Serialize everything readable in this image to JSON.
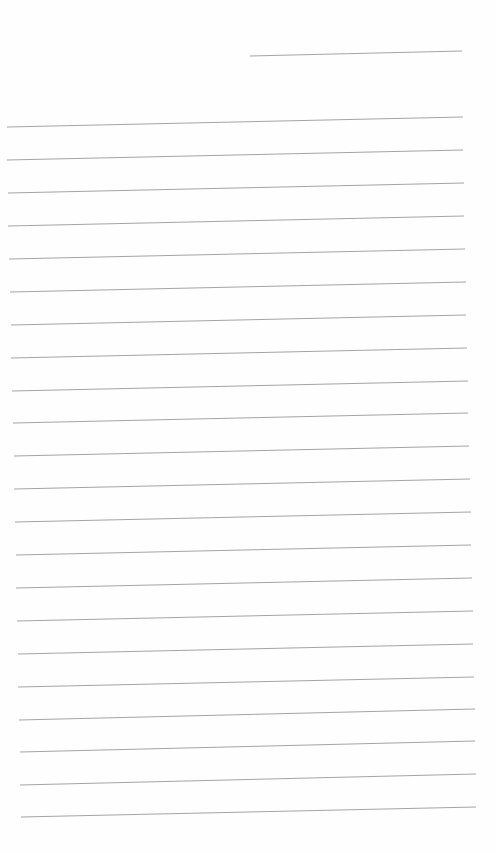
{
  "page": {
    "type": "lined-paper",
    "background": "#fefefe",
    "line_color": "#9a9a9a",
    "header_line": {
      "x1": 250,
      "y1": 56,
      "x2": 462,
      "y2": 51
    },
    "ruled_lines": [
      {
        "x1": 7,
        "y1": 127,
        "x2": 463,
        "y2": 117
      },
      {
        "x1": 7,
        "y1": 160,
        "x2": 463,
        "y2": 150
      },
      {
        "x1": 8,
        "y1": 193,
        "x2": 464,
        "y2": 183
      },
      {
        "x1": 8,
        "y1": 226,
        "x2": 464,
        "y2": 216
      },
      {
        "x1": 9,
        "y1": 259,
        "x2": 465,
        "y2": 249
      },
      {
        "x1": 10,
        "y1": 292,
        "x2": 466,
        "y2": 282
      },
      {
        "x1": 11,
        "y1": 325,
        "x2": 466,
        "y2": 315
      },
      {
        "x1": 11,
        "y1": 358,
        "x2": 467,
        "y2": 348
      },
      {
        "x1": 12,
        "y1": 391,
        "x2": 468,
        "y2": 381
      },
      {
        "x1": 13,
        "y1": 423,
        "x2": 468,
        "y2": 413
      },
      {
        "x1": 14,
        "y1": 456,
        "x2": 469,
        "y2": 446
      },
      {
        "x1": 14,
        "y1": 489,
        "x2": 470,
        "y2": 479
      },
      {
        "x1": 15,
        "y1": 522,
        "x2": 471,
        "y2": 512
      },
      {
        "x1": 16,
        "y1": 555,
        "x2": 471,
        "y2": 545
      },
      {
        "x1": 16,
        "y1": 588,
        "x2": 472,
        "y2": 578
      },
      {
        "x1": 17,
        "y1": 621,
        "x2": 473,
        "y2": 611
      },
      {
        "x1": 18,
        "y1": 654,
        "x2": 473,
        "y2": 644
      },
      {
        "x1": 18,
        "y1": 687,
        "x2": 474,
        "y2": 677
      },
      {
        "x1": 19,
        "y1": 720,
        "x2": 475,
        "y2": 709
      },
      {
        "x1": 20,
        "y1": 752,
        "x2": 475,
        "y2": 741
      },
      {
        "x1": 20,
        "y1": 785,
        "x2": 476,
        "y2": 774
      },
      {
        "x1": 21,
        "y1": 817,
        "x2": 476,
        "y2": 807
      }
    ]
  }
}
